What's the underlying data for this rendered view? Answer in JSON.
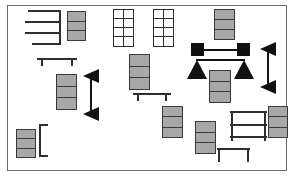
{
  "diagram": {
    "frame": {
      "x": 7,
      "y": 5,
      "w": 280,
      "h": 166,
      "border_color": "#6d6d6d"
    },
    "background": "#ffffff",
    "palette": {
      "module_fill": "#a8a8a8",
      "module_stroke": "#3a3a3a",
      "line": "#2e2e2e",
      "marker": "#111111",
      "frame": "#6d6d6d"
    },
    "legend": {
      "module": "gray three-segment shelving module",
      "grid_unit": "white two-by-four grid cabinet",
      "comb": "comb bracket with horizontal arms",
      "bench": "bench with two legs",
      "rack": "open rack with shelves",
      "dim_arrow": "vertical dimension arrow",
      "square_connector": "black square connector pair",
      "triangle_pair": "black triangle marker pair"
    },
    "shapes": [
      {
        "name": "comb-top-left",
        "kind": "comb",
        "x": 23,
        "y": 9,
        "w": 37,
        "h": 35,
        "arms": 4
      },
      {
        "name": "module-top-left",
        "kind": "module",
        "x": 66,
        "y": 10,
        "w": 19,
        "h": 30,
        "segments": 3
      },
      {
        "name": "grid-unit-left",
        "kind": "grid",
        "x": 112,
        "y": 8,
        "w": 21,
        "h": 38,
        "cols": 2,
        "rows": 4
      },
      {
        "name": "grid-unit-right",
        "kind": "grid",
        "x": 152,
        "y": 8,
        "w": 21,
        "h": 38,
        "cols": 2,
        "rows": 4
      },
      {
        "name": "module-top-right",
        "kind": "module",
        "x": 213,
        "y": 8,
        "w": 21,
        "h": 31,
        "segments": 3
      },
      {
        "name": "square-connector-top",
        "kind": "connector",
        "x": 190,
        "y": 42,
        "w": 59,
        "h": 13
      },
      {
        "name": "triangle-pair-right",
        "kind": "tripair",
        "x": 186,
        "y": 58,
        "w": 67,
        "h": 21
      },
      {
        "name": "dim-arrow-right",
        "kind": "dimarrow",
        "x": 258,
        "y": 41,
        "w": 18,
        "h": 52
      },
      {
        "name": "bench-left-upper",
        "kind": "bench",
        "x": 36,
        "y": 57,
        "w": 40,
        "h": 8,
        "legs": 2
      },
      {
        "name": "module-left-mid",
        "kind": "module",
        "x": 55,
        "y": 73,
        "w": 21,
        "h": 36,
        "segments": 3
      },
      {
        "name": "dim-arrow-left",
        "kind": "dimarrow",
        "x": 81,
        "y": 68,
        "w": 18,
        "h": 52
      },
      {
        "name": "module-center",
        "kind": "module",
        "x": 128,
        "y": 53,
        "w": 21,
        "h": 36,
        "segments": 3
      },
      {
        "name": "bench-center",
        "kind": "bench",
        "x": 132,
        "y": 92,
        "w": 38,
        "h": 8,
        "legs": 2
      },
      {
        "name": "module-right-mid",
        "kind": "module",
        "x": 208,
        "y": 69,
        "w": 22,
        "h": 33,
        "segments": 3
      },
      {
        "name": "module-center-lower",
        "kind": "module",
        "x": 161,
        "y": 105,
        "w": 21,
        "h": 32,
        "segments": 3
      },
      {
        "name": "module-lower-mid",
        "kind": "module",
        "x": 194,
        "y": 120,
        "w": 21,
        "h": 33,
        "segments": 3
      },
      {
        "name": "rack-lower-right",
        "kind": "rack",
        "x": 229,
        "y": 110,
        "w": 37,
        "h": 30,
        "shelves": 3
      },
      {
        "name": "bench-bottom-right",
        "kind": "bench",
        "x": 216,
        "y": 147,
        "w": 33,
        "h": 14,
        "legs": 2
      },
      {
        "name": "module-far-right",
        "kind": "module",
        "x": 267,
        "y": 105,
        "w": 20,
        "h": 32,
        "segments": 3
      },
      {
        "name": "module-bottom-left",
        "kind": "module",
        "x": 15,
        "y": 128,
        "w": 20,
        "h": 29,
        "segments": 3
      },
      {
        "name": "comb-bottom-left",
        "kind": "comb",
        "x": 38,
        "y": 123,
        "w": 9,
        "h": 33,
        "arms": 2
      }
    ]
  }
}
